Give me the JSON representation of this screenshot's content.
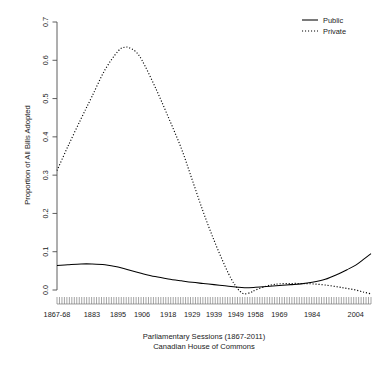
{
  "chart_data": {
    "type": "line",
    "title": "",
    "xlabel": "Parliamentary Sessions (1867-2011)",
    "xlabel_line2": "Canadian House of Commons",
    "ylabel": "Proportion of All Bills Adopted",
    "grid": false,
    "legend_position": "top-right",
    "xlim": [
      1867,
      2011
    ],
    "ylim": [
      -0.03,
      0.7
    ],
    "y_ticks": [
      "0.0",
      "0.1",
      "0.2",
      "0.3",
      "0.4",
      "0.5",
      "0.6",
      "0.7"
    ],
    "y_tick_values": [
      0.0,
      0.1,
      0.2,
      0.3,
      0.4,
      0.5,
      0.6,
      0.7
    ],
    "x_ticks": [
      "1867-68",
      "1883",
      "1895",
      "1906",
      "1918",
      "1929",
      "1939",
      "1949",
      "1958",
      "1969",
      "1984",
      "2004"
    ],
    "x_tick_values": [
      1867,
      1883,
      1895,
      1906,
      1918,
      1929,
      1939,
      1949,
      1958,
      1969,
      1984,
      2004
    ],
    "series": [
      {
        "name": "Public",
        "style": "solid",
        "color": "#000000",
        "x": [
          1867,
          1872,
          1878,
          1883,
          1889,
          1895,
          1900,
          1906,
          1912,
          1918,
          1924,
          1929,
          1934,
          1939,
          1944,
          1949,
          1953,
          1958,
          1963,
          1969,
          1974,
          1979,
          1984,
          1990,
          1996,
          2000,
          2004,
          2008,
          2011
        ],
        "values": [
          0.064,
          0.066,
          0.068,
          0.068,
          0.066,
          0.06,
          0.052,
          0.043,
          0.035,
          0.029,
          0.024,
          0.02,
          0.017,
          0.014,
          0.011,
          0.008,
          0.006,
          0.007,
          0.009,
          0.012,
          0.014,
          0.016,
          0.02,
          0.028,
          0.042,
          0.053,
          0.065,
          0.082,
          0.095
        ]
      },
      {
        "name": "Private",
        "style": "dotted",
        "color": "#000000",
        "x": [
          1867,
          1872,
          1878,
          1883,
          1889,
          1895,
          1898,
          1900,
          1903,
          1906,
          1912,
          1918,
          1924,
          1929,
          1934,
          1939,
          1944,
          1947,
          1949,
          1951,
          1953,
          1956,
          1958,
          1963,
          1966,
          1969,
          1974,
          1979,
          1984,
          1990,
          1996,
          2000,
          2004,
          2008,
          2011
        ],
        "values": [
          0.312,
          0.375,
          0.447,
          0.505,
          0.575,
          0.624,
          0.634,
          0.633,
          0.623,
          0.6,
          0.53,
          0.452,
          0.37,
          0.288,
          0.205,
          0.13,
          0.063,
          0.028,
          0.01,
          -0.004,
          -0.01,
          -0.006,
          0.0,
          0.01,
          0.014,
          0.016,
          0.017,
          0.017,
          0.016,
          0.013,
          0.008,
          0.004,
          0.0,
          -0.006,
          -0.01
        ]
      }
    ],
    "legend": [
      {
        "label": "Public",
        "style": "solid"
      },
      {
        "label": "Private",
        "style": "dotted"
      }
    ],
    "rug_tick_count": 128
  }
}
